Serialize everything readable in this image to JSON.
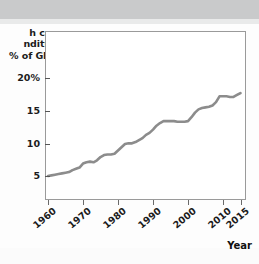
{
  "chart_data": {
    "type": "line",
    "title": "",
    "subtitle": "",
    "ylabel_lines": [
      "h care",
      "nditure",
      "% of GDP)"
    ],
    "ylabel_full": "Health care expenditure (% of GDP)",
    "xlabel": "Year",
    "xlim": [
      1960,
      2016
    ],
    "ylim": [
      0,
      22
    ],
    "grid": false,
    "legend": null,
    "axis_color": "#9a9a9a",
    "line_color": "#8c8c8c",
    "line_width_px": 2.6,
    "plot_background": "#ffffff",
    "yticks": [
      {
        "value": 20,
        "label": "20%"
      },
      {
        "value": 15,
        "label": "15"
      },
      {
        "value": 10,
        "label": "10"
      },
      {
        "value": 5,
        "label": "5"
      }
    ],
    "xticks": [
      {
        "value": 1960,
        "label": "1960"
      },
      {
        "value": 1970,
        "label": "1970"
      },
      {
        "value": 1980,
        "label": "1980"
      },
      {
        "value": 1990,
        "label": "1990"
      },
      {
        "value": 2000,
        "label": "2000"
      },
      {
        "value": 2010,
        "label": "2010"
      },
      {
        "value": 2015,
        "label": "2015"
      }
    ],
    "series": [
      {
        "name": "Health care expenditure (% of GDP)",
        "x": [
          1960,
          1961,
          1962,
          1963,
          1964,
          1965,
          1966,
          1967,
          1968,
          1969,
          1970,
          1971,
          1972,
          1973,
          1974,
          1975,
          1976,
          1977,
          1978,
          1979,
          1980,
          1981,
          1982,
          1983,
          1984,
          1985,
          1986,
          1987,
          1988,
          1989,
          1990,
          1991,
          1992,
          1993,
          1994,
          1995,
          1996,
          1997,
          1998,
          1999,
          2000,
          2001,
          2002,
          2003,
          2004,
          2005,
          2006,
          2007,
          2008,
          2009,
          2010,
          2011,
          2012,
          2013,
          2014,
          2015
        ],
        "values": [
          5.0,
          5.1,
          5.2,
          5.3,
          5.4,
          5.5,
          5.6,
          5.9,
          6.1,
          6.3,
          6.9,
          7.1,
          7.2,
          7.1,
          7.4,
          7.9,
          8.2,
          8.3,
          8.3,
          8.4,
          8.9,
          9.4,
          9.9,
          10.0,
          10.0,
          10.2,
          10.5,
          10.8,
          11.3,
          11.6,
          12.1,
          12.7,
          13.1,
          13.4,
          13.4,
          13.4,
          13.4,
          13.3,
          13.3,
          13.3,
          13.4,
          14.0,
          14.7,
          15.2,
          15.4,
          15.5,
          15.6,
          15.8,
          16.3,
          17.2,
          17.2,
          17.2,
          17.1,
          17.1,
          17.4,
          17.7
        ],
        "color": "#8c8c8c"
      }
    ],
    "annotations": [
      "Rises steadily from about 5% of GDP in 1960 to about 17.7% in 2015",
      "Plateau near 13.3-13.4% between roughly 1993 and 2000"
    ]
  }
}
